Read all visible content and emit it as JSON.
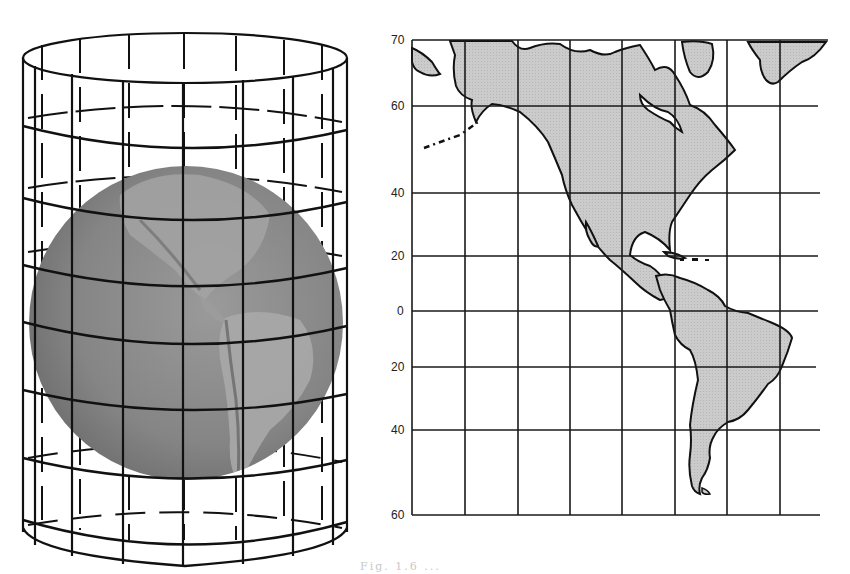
{
  "figure": {
    "type": "cylindrical-projection-illustration",
    "left_panel": {
      "subject": "globe-inside-cylinder",
      "globe_region": "Americas (Pacific view)",
      "cylinder_color": "#111111",
      "globe_color": "#8a8a8a"
    },
    "right_panel": {
      "subject": "cylindrical-projection-map",
      "region": "North and South America",
      "land_color": "#c9c9c9",
      "grid_color": "#1a1a1a",
      "latitude_labels": [
        "70",
        "60",
        "40",
        "20",
        "0",
        "20",
        "40",
        "60"
      ],
      "latitude_values": [
        70,
        60,
        40,
        20,
        0,
        -20,
        -40,
        -60
      ]
    },
    "caption_fragment": "Fig. 1.6 ..."
  }
}
